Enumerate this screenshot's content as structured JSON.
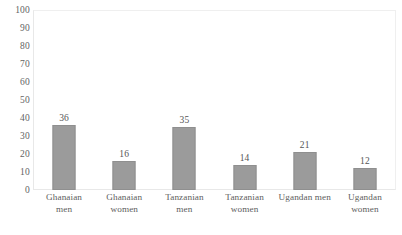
{
  "chart_data": {
    "type": "bar",
    "title": "",
    "subtitle": "",
    "xlabel": "",
    "ylabel": "",
    "ylim": [
      0,
      100
    ],
    "grid": false,
    "legend": "none",
    "bar_color": "#9b9b9b",
    "yticks": [
      "100",
      "90",
      "80",
      "70",
      "60",
      "50",
      "40",
      "30",
      "20",
      "10",
      "0"
    ],
    "ytick_values": [
      100,
      90,
      80,
      70,
      60,
      50,
      40,
      30,
      20,
      10,
      0
    ],
    "categories": [
      "Ghanaian men",
      "Ghanaian women",
      "Tanzanian men",
      "Tanzanian women",
      "Ugandan men",
      "Ugandan women"
    ],
    "category_lines": [
      [
        "Ghanaian",
        "men"
      ],
      [
        "Ghanaian",
        "women"
      ],
      [
        "Tanzanian",
        "men"
      ],
      [
        "Tanzanian",
        "women"
      ],
      [
        "Ugandan men"
      ],
      [
        "Ugandan",
        "women"
      ]
    ],
    "values": [
      36,
      16,
      35,
      14,
      21,
      12
    ],
    "value_labels": [
      "36",
      "16",
      "35",
      "14",
      "21",
      "12"
    ]
  }
}
